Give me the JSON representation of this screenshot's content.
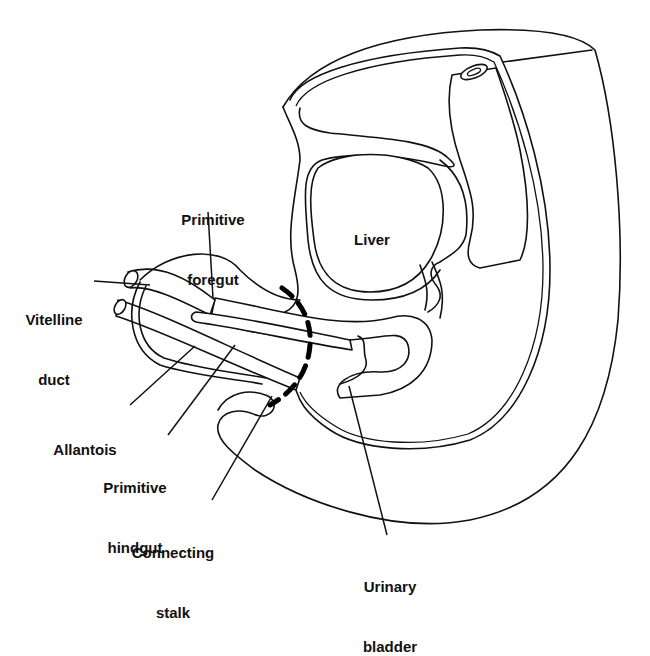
{
  "figure": {
    "type": "anatomical-sagittal-section",
    "colors": {
      "line": "#111111",
      "background": "#ffffff"
    }
  },
  "labels": {
    "primitive_foregut": {
      "line1": "Primitive",
      "line2": "foregut"
    },
    "liver": {
      "line1": "Liver"
    },
    "vitelline_duct": {
      "line1": "Vitelline",
      "line2": "duct"
    },
    "allantois": {
      "line1": "Allantois"
    },
    "primitive_hindgut": {
      "line1": "Primitive",
      "line2": "hindgut"
    },
    "connecting_stalk": {
      "line1": "Connecting",
      "line2": "stalk"
    },
    "urinary_bladder": {
      "line1": "Urinary",
      "line2": "bladder"
    }
  },
  "annotations": {
    "dashed_boundary": "Bold dashed curve marking body-wall boundary"
  }
}
